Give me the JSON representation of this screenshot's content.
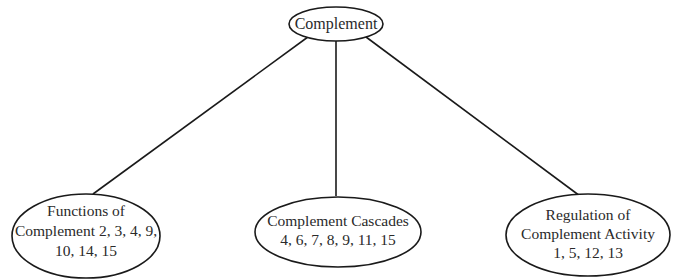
{
  "diagram": {
    "root": {
      "label": "Complement"
    },
    "children": [
      {
        "lines": [
          "Functions of",
          "Complement 2, 3, 4, 9,",
          "10, 14, 15"
        ]
      },
      {
        "lines": [
          "Complement Cascades",
          "4, 6, 7, 8, 9, 11, 15"
        ]
      },
      {
        "lines": [
          "Regulation of",
          "Complement Activity",
          "1, 5, 12, 13"
        ]
      }
    ],
    "colors": {
      "stroke": "#1a1a1a",
      "text": "#2a2a2a",
      "background": "#ffffff"
    }
  }
}
